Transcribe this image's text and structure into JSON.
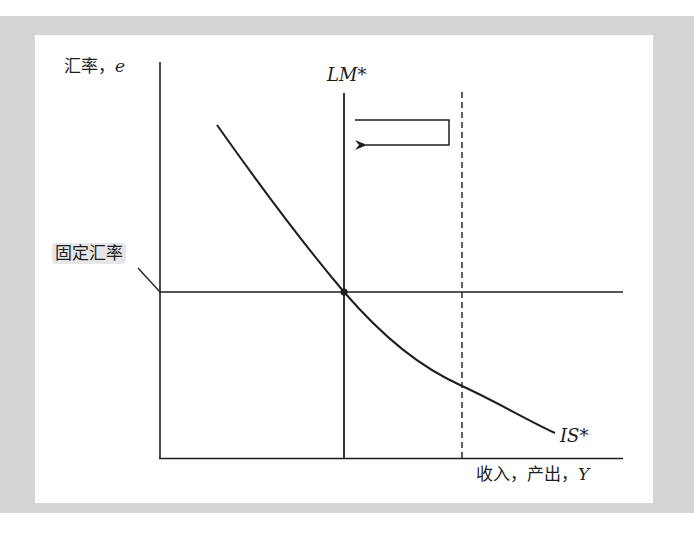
{
  "diagram": {
    "title": "",
    "y_axis": {
      "label_text": "汇率，",
      "label_var": "e"
    },
    "x_axis": {
      "label_text": "收入，产出，",
      "label_var": "Y"
    },
    "fixed_rate_label": "固定汇率",
    "curves": {
      "lm_star": {
        "label": "LM*",
        "style": "solid",
        "orientation": "vertical"
      },
      "is_star": {
        "label": "IS*",
        "style": "solid",
        "shape": "downward-sloping convex"
      },
      "shifted_lm": {
        "label": "",
        "style": "dashed",
        "orientation": "vertical"
      },
      "fixed_rate_line": {
        "label": "固定汇率",
        "style": "solid",
        "orientation": "horizontal"
      }
    },
    "annotations": {
      "shift_arrow": {
        "direction": "left",
        "from": "shifted_lm",
        "to": "lm_star"
      },
      "equilibrium_point": {
        "at": "IS* ∩ LM* ∩ fixed rate"
      }
    },
    "colors": {
      "line": "#1e1e1e",
      "background_frame": "#d5d5d5",
      "panel": "#ffffff",
      "label_highlight": "#e6e6e6"
    }
  }
}
